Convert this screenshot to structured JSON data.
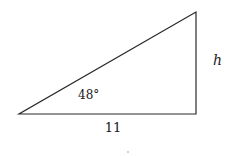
{
  "diagram": {
    "type": "right-triangle",
    "angle_label": "48°",
    "base_label": "11",
    "height_label": "h",
    "vertices": {
      "left": [
        19,
        114
      ],
      "right_bottom": [
        196,
        114
      ],
      "top": [
        196,
        12
      ]
    },
    "stroke_color": "#2a2a2a"
  }
}
